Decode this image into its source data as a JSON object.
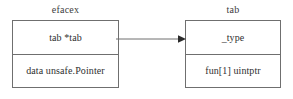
{
  "diagram": {
    "type": "struct-relationship",
    "background_color": "#ffffff",
    "line_color": "#6f6f6f",
    "text_color": "#2f2f2f",
    "entities": [
      {
        "id": "left",
        "title": "efacex",
        "rows": [
          "tab *tab",
          "data unsafe.Pointer"
        ]
      },
      {
        "id": "right",
        "title": "tab",
        "rows": [
          "_type",
          "fun[1] uintptr"
        ]
      }
    ],
    "connector": {
      "name": "pointer-arrow",
      "from": "efacex.tab *tab",
      "to": "tab",
      "style": "solid",
      "arrowhead": "filled-triangle"
    }
  }
}
